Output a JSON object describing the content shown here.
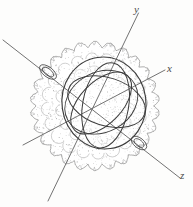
{
  "figure": {
    "background_color": "#fdfdfc",
    "ink_color": "#5a5a5a",
    "stipple_color": "#9a9a9a",
    "curve_color": "#3c3c3c",
    "width": 193,
    "height": 207
  },
  "axes": [
    {
      "name": "y-axis",
      "label": "y",
      "label_x": 134,
      "label_y": 4,
      "x1": 138.5,
      "y1": 13.0,
      "x2": 48.0,
      "y2": 201.0,
      "color": "#6a6a6a"
    },
    {
      "name": "x-axis",
      "label": "x",
      "label_x": 167,
      "label_y": 63,
      "x1": 165.0,
      "y1": 70.0,
      "x2": 23.0,
      "y2": 145.0,
      "color": "#6a6a6a"
    },
    {
      "name": "z-axis",
      "label": "z",
      "label_x": 180,
      "label_y": 170,
      "x1": 3.0,
      "y1": 40.0,
      "x2": 180.0,
      "y2": 178.0,
      "color": "#6a6a6a"
    }
  ],
  "sphere": {
    "name": "stippled-sphere",
    "center_x": 95,
    "center_y": 106,
    "radius": 62,
    "lobe_count": 26,
    "lobe_depth": 6,
    "stipple_density": 900,
    "description": "Lobed / scalloped outline filled with fine stipple dots"
  },
  "inner_region": {
    "name": "inner-orbit-cluster",
    "center_x": 104,
    "center_y": 103,
    "outer_rx": 42,
    "outer_ry": 46,
    "rotation_deg": -8,
    "loop_count": 4,
    "description": "Cluster of overlapping closed great-circle loops drawn in darker ink"
  },
  "pole_ellipses": [
    {
      "name": "pole-ellipse-upper-left",
      "cx": 48,
      "cy": 72,
      "rx": 10,
      "ry": 5,
      "rotation_deg": 38
    },
    {
      "name": "pole-ellipse-lower-right",
      "cx": 139,
      "cy": 143,
      "rx": 9,
      "ry": 5,
      "rotation_deg": 38
    }
  ]
}
